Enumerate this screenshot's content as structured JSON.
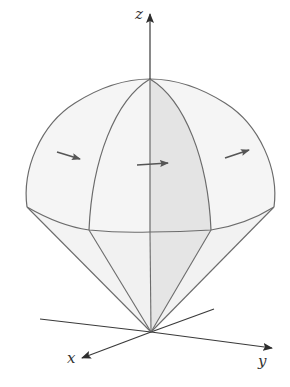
{
  "figure": {
    "colors": {
      "stroke": "#6b6b6b",
      "axis": "#3a3a3a",
      "surface_light": "#f4f4f4",
      "surface_shaded": "#e6e6e6",
      "arrow": "#555555",
      "background": "#ffffff"
    },
    "axes": {
      "x_label": "x",
      "y_label": "y",
      "z_label": "z"
    },
    "surface_arrows": [
      {
        "name": "left",
        "from": [
          57,
          152
        ],
        "to": [
          80,
          159
        ]
      },
      {
        "name": "middle",
        "from": [
          137,
          165
        ],
        "to": [
          168,
          163
        ]
      },
      {
        "name": "right",
        "from": [
          225,
          158
        ],
        "to": [
          249,
          150
        ]
      }
    ]
  }
}
